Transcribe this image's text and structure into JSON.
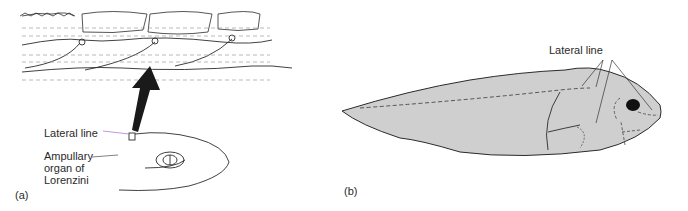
{
  "figure": {
    "panels": [
      {
        "id": "a",
        "tag": "(a)",
        "labels": {
          "lateral_line": "Lateral line",
          "ampullary": "Ampullary\norgan of\nLorenzini"
        },
        "subjects": [
          "lateral-line canal cross-section (magnified)",
          "shark head"
        ]
      },
      {
        "id": "b",
        "tag": "(b)",
        "labels": {
          "lateral_line": "Lateral line"
        },
        "subjects": [
          "fish body side view"
        ]
      }
    ],
    "colors": {
      "fish_fill": "#cfcfcf",
      "ink": "#2b2b2b",
      "arrow": "#1a1a1a",
      "pointer_accent": "#b07cd8"
    }
  }
}
